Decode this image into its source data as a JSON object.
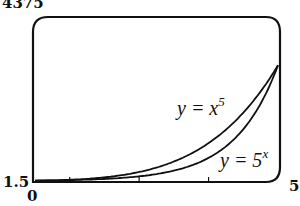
{
  "chart_data": {
    "type": "line",
    "title": "",
    "xlabel": "",
    "ylabel": "",
    "xlim": [
      1.5,
      5
    ],
    "ylim": [
      0,
      4375
    ],
    "grid": false,
    "legend": "inline curve labels",
    "axis_labels": {
      "x_min": "1.5",
      "x_max": "5",
      "y_min": "0",
      "y_max": "4375"
    },
    "series": [
      {
        "name": "y = x^5",
        "label_base": "y = x",
        "label_exp": "5",
        "x": [
          1.5,
          2,
          2.5,
          3,
          3.5,
          4,
          4.5,
          5
        ],
        "values": [
          7.6,
          32,
          97.7,
          243,
          525.2,
          1024,
          1845.3,
          3125
        ]
      },
      {
        "name": "y = 5^x",
        "label_base": "y = 5",
        "label_exp": "x",
        "x": [
          1.5,
          2,
          2.5,
          3,
          3.5,
          4,
          4.5,
          5
        ],
        "values": [
          11.2,
          25,
          55.9,
          125,
          279.5,
          625,
          1397.5,
          3125
        ]
      }
    ],
    "annotations": [
      "y = x^5",
      "y = 5^x"
    ]
  }
}
